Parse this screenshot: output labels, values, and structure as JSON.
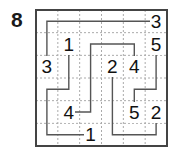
{
  "puzzle": {
    "number": "8",
    "type": "numberlink",
    "rows": 6,
    "cols": 6,
    "colors": {
      "border": "#444444",
      "gridline": "#aaaaaa",
      "path": "#555555",
      "clue_text": "#111111"
    },
    "clues": [
      {
        "row": 0,
        "col": 5,
        "value": "3"
      },
      {
        "row": 1,
        "col": 1,
        "value": "1"
      },
      {
        "row": 1,
        "col": 5,
        "value": "5"
      },
      {
        "row": 2,
        "col": 0,
        "value": "3"
      },
      {
        "row": 2,
        "col": 3,
        "value": "2"
      },
      {
        "row": 2,
        "col": 4,
        "value": "4"
      },
      {
        "row": 4,
        "col": 1,
        "value": "4"
      },
      {
        "row": 4,
        "col": 4,
        "value": "5"
      },
      {
        "row": 4,
        "col": 5,
        "value": "2"
      },
      {
        "row": 5,
        "col": 2,
        "value": "1"
      }
    ],
    "paths": [
      {
        "label": "3",
        "cells": [
          [
            2,
            0
          ],
          [
            1,
            0
          ],
          [
            0,
            0
          ],
          [
            0,
            1
          ],
          [
            0,
            2
          ],
          [
            0,
            3
          ],
          [
            0,
            4
          ],
          [
            0,
            5
          ]
        ]
      },
      {
        "label": "1",
        "cells": [
          [
            1,
            1
          ],
          [
            2,
            1
          ],
          [
            3,
            1
          ],
          [
            3,
            0
          ],
          [
            4,
            0
          ],
          [
            5,
            0
          ],
          [
            5,
            1
          ],
          [
            5,
            2
          ]
        ]
      },
      {
        "label": "4",
        "cells": [
          [
            4,
            1
          ],
          [
            4,
            2
          ],
          [
            3,
            2
          ],
          [
            2,
            2
          ],
          [
            1,
            2
          ],
          [
            1,
            3
          ],
          [
            1,
            4
          ],
          [
            2,
            4
          ]
        ]
      },
      {
        "label": "2",
        "cells": [
          [
            2,
            3
          ],
          [
            3,
            3
          ],
          [
            4,
            3
          ],
          [
            5,
            3
          ],
          [
            5,
            4
          ],
          [
            5,
            5
          ],
          [
            4,
            5
          ]
        ]
      },
      {
        "label": "5",
        "cells": [
          [
            1,
            5
          ],
          [
            2,
            5
          ],
          [
            3,
            5
          ],
          [
            3,
            4
          ],
          [
            4,
            4
          ]
        ]
      }
    ]
  }
}
